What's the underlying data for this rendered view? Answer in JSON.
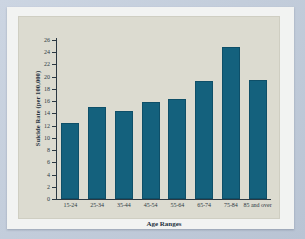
{
  "chart_data": {
    "type": "bar",
    "title": "",
    "xlabel": "Age Ranges",
    "ylabel": "Suicide Rate (per 100,000)",
    "categories": [
      "15-24",
      "25-34",
      "35-44",
      "45-54",
      "55-64",
      "65-74",
      "75-84",
      "85 and over"
    ],
    "values": [
      12.4,
      15.1,
      14.4,
      15.8,
      16.4,
      19.3,
      24.8,
      19.5
    ],
    "ylim": [
      0,
      26
    ],
    "ytick_labels": [
      "0",
      "2",
      "4",
      "6",
      "8",
      "10",
      "12",
      "14",
      "16",
      "18",
      "20",
      "22",
      "24",
      "26"
    ],
    "ytick_values": [
      0,
      2,
      4,
      6,
      8,
      10,
      12,
      14,
      16,
      18,
      20,
      22,
      24,
      26
    ],
    "grid": false,
    "legend": null,
    "series": [
      {
        "name": "Suicide Rate",
        "values": [
          12.4,
          15.1,
          14.4,
          15.8,
          16.4,
          19.3,
          24.8,
          19.5
        ]
      }
    ],
    "colors": {
      "bar": "#14617d",
      "bar_edge": "#0e4f68",
      "plot_background": "#dcdbd0",
      "paper": "#f2f3f2",
      "page_background": "#c5cfdd",
      "axis": "#2b3842",
      "text": "#25323f"
    }
  }
}
